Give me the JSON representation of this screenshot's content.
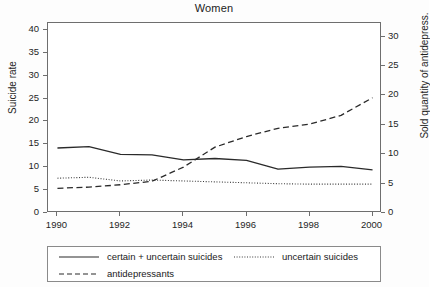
{
  "chart_data": {
    "type": "line",
    "title": "Women",
    "xlabel": "",
    "ylabel": "Suicide rate",
    "ylabel_right": "Sold quantity of antidepress.",
    "x": [
      1990,
      1991,
      1992,
      1993,
      1994,
      1995,
      1996,
      1997,
      1998,
      1999,
      2000
    ],
    "xlim": [
      1989.7,
      2000.3
    ],
    "ylim": [
      0,
      41.5
    ],
    "ylim_right": [
      0,
      32.3
    ],
    "xticks": [
      1990,
      1992,
      1994,
      1996,
      1998,
      2000
    ],
    "xticklabels": [
      "1990",
      "1992",
      "1994",
      "1996",
      "1998",
      "2000"
    ],
    "yticks": [
      0,
      5,
      10,
      15,
      20,
      25,
      30,
      35,
      40
    ],
    "yticklabels": [
      "0",
      "5",
      "10",
      "15",
      "20",
      "25",
      "30",
      "35",
      "40"
    ],
    "yticks_right": [
      0,
      5,
      10,
      15,
      20,
      25,
      30
    ],
    "yticklabels_right": [
      "0",
      "5",
      "10",
      "15",
      "20",
      "25",
      "30"
    ],
    "grid": false,
    "legend_position": "below-axes",
    "series": [
      {
        "name": "certain + uncertain suicides",
        "axis": "left",
        "style": "solid",
        "color": "#2a2a2a",
        "values": [
          14.2,
          14.5,
          12.8,
          12.7,
          11.6,
          11.9,
          11.5,
          9.6,
          10.0,
          10.2,
          9.4
        ]
      },
      {
        "name": "uncertain suicides",
        "axis": "left",
        "style": "dotted",
        "color": "#3a3a3a",
        "values": [
          7.6,
          7.8,
          7.0,
          7.2,
          7.0,
          6.8,
          6.6,
          6.4,
          6.3,
          6.3,
          6.3
        ]
      },
      {
        "name": "antidepressants",
        "axis": "right",
        "style": "dashed",
        "color": "#2a2a2a",
        "values": [
          4.2,
          4.4,
          4.8,
          5.4,
          7.8,
          11.2,
          13.0,
          14.4,
          15.1,
          16.6,
          19.6
        ]
      }
    ]
  },
  "legend": {
    "entries": [
      {
        "label": "certain + uncertain suicides",
        "style": "solid"
      },
      {
        "label": "uncertain suicides",
        "style": "dotted"
      },
      {
        "label": "antidepressants",
        "style": "dashed"
      }
    ]
  }
}
